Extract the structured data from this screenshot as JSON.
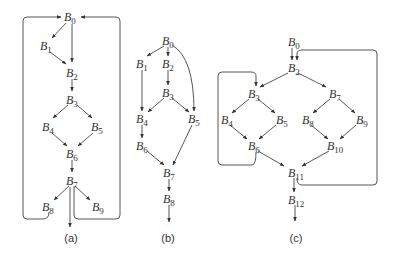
{
  "figure": {
    "panels": [
      {
        "caption": "(a)",
        "nodes": [
          {
            "id": "B0",
            "label": "B",
            "sub": "0",
            "x": 70,
            "y": 17
          },
          {
            "id": "B1",
            "label": "B",
            "sub": "1",
            "x": 45,
            "y": 47
          },
          {
            "id": "B2",
            "label": "B",
            "sub": "2",
            "x": 72,
            "y": 73
          },
          {
            "id": "B3",
            "label": "B",
            "sub": "3",
            "x": 72,
            "y": 100
          },
          {
            "id": "B4",
            "label": "B",
            "sub": "4",
            "x": 48,
            "y": 127
          },
          {
            "id": "B5",
            "label": "B",
            "sub": "5",
            "x": 97,
            "y": 127
          },
          {
            "id": "B6",
            "label": "B",
            "sub": "6",
            "x": 72,
            "y": 154
          },
          {
            "id": "B7",
            "label": "B",
            "sub": "7",
            "x": 72,
            "y": 181
          },
          {
            "id": "B8",
            "label": "B",
            "sub": "8",
            "x": 48,
            "y": 207
          },
          {
            "id": "B9",
            "label": "B",
            "sub": "9",
            "x": 97,
            "y": 207
          }
        ],
        "edges": [
          [
            "B0",
            "B1"
          ],
          [
            "B0",
            "B2"
          ],
          [
            "B1",
            "B2"
          ],
          [
            "B2",
            "B3"
          ],
          [
            "B3",
            "B4"
          ],
          [
            "B3",
            "B5"
          ],
          [
            "B4",
            "B6"
          ],
          [
            "B5",
            "B6"
          ],
          [
            "B6",
            "B7"
          ],
          [
            "B7",
            "B8"
          ],
          [
            "B7",
            "B9"
          ],
          [
            "B7",
            "exit"
          ],
          [
            "B8",
            "B0"
          ],
          [
            "B7",
            "B0"
          ]
        ]
      },
      {
        "caption": "(b)",
        "nodes": [
          {
            "id": "B0",
            "label": "B",
            "sub": "0",
            "x": 168,
            "y": 41
          },
          {
            "id": "B1",
            "label": "B",
            "sub": "1",
            "x": 142,
            "y": 64
          },
          {
            "id": "B2",
            "label": "B",
            "sub": "2",
            "x": 168,
            "y": 64
          },
          {
            "id": "B3",
            "label": "B",
            "sub": "3",
            "x": 168,
            "y": 93
          },
          {
            "id": "B4",
            "label": "B",
            "sub": "4",
            "x": 142,
            "y": 119
          },
          {
            "id": "B5",
            "label": "B",
            "sub": "5",
            "x": 194,
            "y": 119
          },
          {
            "id": "B6",
            "label": "B",
            "sub": "6",
            "x": 142,
            "y": 146
          },
          {
            "id": "B7",
            "label": "B",
            "sub": "7",
            "x": 169,
            "y": 173
          },
          {
            "id": "B8",
            "label": "B",
            "sub": "8",
            "x": 169,
            "y": 199
          }
        ],
        "edges": [
          [
            "B0",
            "B1"
          ],
          [
            "B0",
            "B2"
          ],
          [
            "B0",
            "B5"
          ],
          [
            "B1",
            "B4"
          ],
          [
            "B2",
            "B3"
          ],
          [
            "B3",
            "B4"
          ],
          [
            "B3",
            "B5"
          ],
          [
            "B4",
            "B6"
          ],
          [
            "B6",
            "B7"
          ],
          [
            "B5",
            "B7"
          ],
          [
            "B7",
            "B8"
          ],
          [
            "B8",
            "exit"
          ]
        ]
      },
      {
        "caption": "(c)",
        "nodes": [
          {
            "id": "B0",
            "label": "B",
            "sub": "0",
            "x": 293,
            "y": 42
          },
          {
            "id": "B2",
            "label": "B",
            "sub": "2",
            "x": 293,
            "y": 68
          },
          {
            "id": "B3",
            "label": "B",
            "sub": "3",
            "x": 253,
            "y": 94
          },
          {
            "id": "B7",
            "label": "B",
            "sub": "7",
            "x": 334,
            "y": 94
          },
          {
            "id": "B4",
            "label": "B",
            "sub": "4",
            "x": 226,
            "y": 120
          },
          {
            "id": "B5",
            "label": "B",
            "sub": "5",
            "x": 280,
            "y": 120
          },
          {
            "id": "B8",
            "label": "B",
            "sub": "8",
            "x": 307,
            "y": 120
          },
          {
            "id": "B9",
            "label": "B",
            "sub": "9",
            "x": 360,
            "y": 120
          },
          {
            "id": "B6",
            "label": "B",
            "sub": "6",
            "x": 253,
            "y": 146
          },
          {
            "id": "B10",
            "label": "B",
            "sub": "10",
            "x": 334,
            "y": 146
          },
          {
            "id": "B11",
            "label": "B",
            "sub": "11",
            "x": 295,
            "y": 173
          },
          {
            "id": "B12",
            "label": "B",
            "sub": "12",
            "x": 295,
            "y": 200
          }
        ],
        "edges": [
          [
            "B0",
            "B2"
          ],
          [
            "B2",
            "B3"
          ],
          [
            "B2",
            "B7"
          ],
          [
            "B3",
            "B4"
          ],
          [
            "B3",
            "B5"
          ],
          [
            "B7",
            "B8"
          ],
          [
            "B7",
            "B9"
          ],
          [
            "B4",
            "B6"
          ],
          [
            "B5",
            "B6"
          ],
          [
            "B8",
            "B10"
          ],
          [
            "B9",
            "B10"
          ],
          [
            "B6",
            "B11"
          ],
          [
            "B10",
            "B11"
          ],
          [
            "B11",
            "B12"
          ],
          [
            "B12",
            "exit"
          ],
          [
            "B6",
            "B3"
          ],
          [
            "B11",
            "B2"
          ]
        ]
      }
    ]
  }
}
